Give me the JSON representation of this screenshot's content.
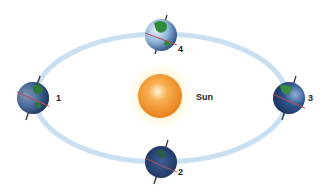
{
  "diagram": {
    "sun": {
      "label": "Sun",
      "cx": 160,
      "cy": 96,
      "r": 22
    },
    "orbit": {
      "cx": 161,
      "cy": 98,
      "rx": 126,
      "ry": 64,
      "color": "#c8e0f2"
    },
    "earths": [
      {
        "id": "1",
        "label": "1",
        "cx": 33,
        "cy": 98
      },
      {
        "id": "2",
        "label": "2",
        "cx": 161,
        "cy": 162
      },
      {
        "id": "3",
        "label": "3",
        "cx": 289,
        "cy": 98
      },
      {
        "id": "4",
        "label": "4",
        "cx": 161,
        "cy": 35
      }
    ]
  }
}
